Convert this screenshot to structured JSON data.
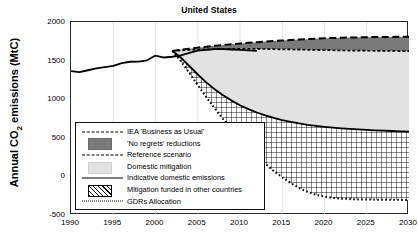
{
  "figure": {
    "title": "United States",
    "ylabel_full": "Annual CO2 emissions (MtC)",
    "ylabel_pre": "Annual CO",
    "ylabel_sub": "2",
    "ylabel_post": " emissions (MtC)"
  },
  "axes": {
    "yticks": [
      "2000",
      "1500",
      "1000",
      "500",
      "0",
      "-500"
    ],
    "xticks": [
      "1990",
      "1995",
      "2000",
      "2005",
      "2010",
      "2015",
      "2020",
      "2025",
      "2030"
    ],
    "ylim": [
      -500,
      2000
    ],
    "xlim": [
      1990,
      2030
    ],
    "grid": "light vertical gridlines at each x tick"
  },
  "legend": {
    "entries": [
      {
        "label": "IEA 'Business as Usual'",
        "key": "long-dashed-line",
        "color": "#000000"
      },
      {
        "label": "'No regrets' reductions",
        "key": "dark-gray-swatch",
        "color": "#7a7a7a"
      },
      {
        "label": "Reference scenario",
        "key": "short-dashed-line",
        "color": "#000000"
      },
      {
        "label": "Domestic mitigation",
        "key": "light-gray-swatch",
        "color": "#e2e2e2"
      },
      {
        "label": "Indicative domestic emissions",
        "key": "solid-line",
        "color": "#000000"
      },
      {
        "label": "Mitigation funded in other countries",
        "key": "diagonal-hatch-swatch",
        "color": "#000000"
      },
      {
        "label": "GDRs Allocation",
        "key": "dotted-line",
        "color": "#000000"
      }
    ]
  },
  "chart_data": {
    "type": "line",
    "title": "United States",
    "xlabel": "",
    "ylabel": "Annual CO2 emissions (MtC)",
    "xlim": [
      1990,
      2030
    ],
    "ylim": [
      -500,
      2000
    ],
    "grid": true,
    "legend_position": "lower-left inside axes",
    "x": [
      1990,
      1991,
      1992,
      1993,
      1994,
      1995,
      1996,
      1997,
      1998,
      1999,
      2000,
      2001,
      2002,
      2003,
      2004,
      2005,
      2006,
      2007,
      2008,
      2009,
      2010,
      2011,
      2012,
      2013,
      2014,
      2015,
      2016,
      2017,
      2018,
      2019,
      2020,
      2021,
      2022,
      2023,
      2024,
      2025,
      2026,
      2027,
      2028,
      2029,
      2030
    ],
    "series": [
      {
        "name": "Historical emissions",
        "style": "solid",
        "values": [
          1365,
          1352,
          1375,
          1398,
          1416,
          1432,
          1468,
          1485,
          1488,
          1504,
          1565,
          1540,
          1550,
          1568,
          1600,
          1628,
          1640,
          1648,
          1648,
          1644,
          1638,
          1632,
          1625,
          null,
          null,
          null,
          null,
          null,
          null,
          null,
          null,
          null,
          null,
          null,
          null,
          null,
          null,
          null,
          null,
          null,
          null
        ]
      },
      {
        "name": "IEA 'Business as Usual'",
        "style": "long-dashed",
        "values": [
          null,
          null,
          null,
          null,
          null,
          null,
          null,
          null,
          null,
          null,
          null,
          null,
          1625,
          1640,
          1655,
          1668,
          1680,
          1692,
          1702,
          1712,
          1722,
          1731,
          1739,
          1747,
          1754,
          1760,
          1766,
          1772,
          1778,
          1784,
          1789,
          1793,
          1796,
          1799,
          1801,
          1803,
          1805,
          1806,
          1807,
          1808,
          1810
        ]
      },
      {
        "name": "Reference scenario",
        "style": "short-dashed",
        "values": [
          null,
          null,
          null,
          null,
          null,
          null,
          null,
          null,
          null,
          null,
          null,
          null,
          1625,
          1632,
          1638,
          1642,
          1645,
          1648,
          1650,
          1651,
          1652,
          1652,
          1651,
          1650,
          1648,
          1646,
          1644,
          1642,
          1640,
          1638,
          1636,
          1634,
          1632,
          1630,
          1629,
          1628,
          1627,
          1626,
          1625,
          1624,
          1623
        ]
      },
      {
        "name": "Indicative domestic emissions",
        "style": "solid",
        "values": [
          null,
          null,
          null,
          null,
          null,
          null,
          null,
          null,
          null,
          null,
          null,
          null,
          1625,
          1540,
          1430,
          1320,
          1218,
          1128,
          1050,
          982,
          922,
          872,
          828,
          790,
          758,
          730,
          706,
          686,
          668,
          654,
          642,
          632,
          623,
          615,
          608,
          602,
          597,
          592,
          588,
          584,
          580
        ]
      },
      {
        "name": "GDRs Allocation",
        "style": "dotted",
        "values": [
          null,
          null,
          null,
          null,
          null,
          null,
          null,
          null,
          null,
          null,
          null,
          null,
          1625,
          1492,
          1340,
          1182,
          1028,
          882,
          742,
          610,
          486,
          370,
          262,
          162,
          70,
          -12,
          -86,
          -150,
          -200,
          -238,
          -262,
          -278,
          -288,
          -294,
          -298,
          -300,
          -301,
          -302,
          -303,
          -304,
          -305
        ]
      }
    ],
    "bands": [
      {
        "name": "'No regrets' reductions",
        "between": [
          "IEA 'Business as Usual'",
          "Reference scenario"
        ],
        "fill": "#7a7a7a"
      },
      {
        "name": "Domestic mitigation",
        "between": [
          "Reference scenario",
          "Indicative domestic emissions"
        ],
        "fill": "#e2e2e2"
      },
      {
        "name": "Mitigation funded in other countries",
        "between": [
          "Indicative domestic emissions",
          "GDRs Allocation"
        ],
        "fill": "diagonal-crosshatch"
      }
    ]
  }
}
